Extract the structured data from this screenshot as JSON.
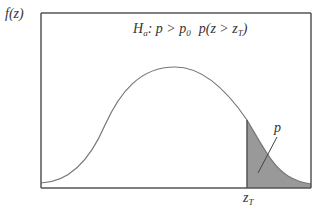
{
  "diagram": {
    "y_axis_label": "f(z)",
    "hypothesis": {
      "H": "H",
      "H_sub": "a",
      "relation": ": p > p",
      "relation_sub": "0",
      "prob": "p(z > z",
      "prob_sub": "T",
      "prob_close": ")"
    },
    "critical_value": {
      "main": "z",
      "sub": "T"
    },
    "shaded_area_label": "p",
    "colors": {
      "axis": "#555555",
      "curve": "#777777",
      "shade": "#999999",
      "text": "#333333"
    }
  }
}
